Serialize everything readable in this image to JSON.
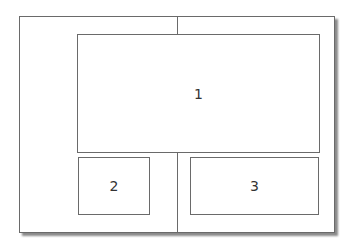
{
  "diagram": {
    "type": "layout-wireframe",
    "regions": [
      {
        "id": "1",
        "label": "1"
      },
      {
        "id": "2",
        "label": "2"
      },
      {
        "id": "3",
        "label": "3"
      }
    ],
    "colors": {
      "line": "#6a6a6a",
      "background": "#ffffff",
      "shadow": "#8a8a8a"
    }
  }
}
